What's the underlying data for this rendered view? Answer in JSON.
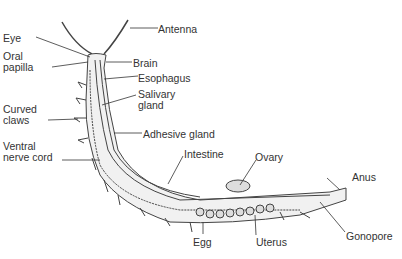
{
  "diagram": {
    "labels": {
      "antenna": "Antenna",
      "eye": "Eye",
      "oral_papilla_1": "Oral",
      "oral_papilla_2": "papilla",
      "brain": "Brain",
      "esophagus": "Esophagus",
      "salivary_1": "Salivary",
      "salivary_2": "gland",
      "curved_1": "Curved",
      "curved_2": "claws",
      "adhesive": "Adhesive gland",
      "ventral_1": "Ventral",
      "ventral_2": "nerve cord",
      "intestine": "Intestine",
      "ovary": "Ovary",
      "anus": "Anus",
      "egg": "Egg",
      "uterus": "Uterus",
      "gonopore": "Gonopore"
    },
    "colors": {
      "line": "#333333",
      "fill": "#e8e8e8",
      "background": "#ffffff"
    }
  }
}
